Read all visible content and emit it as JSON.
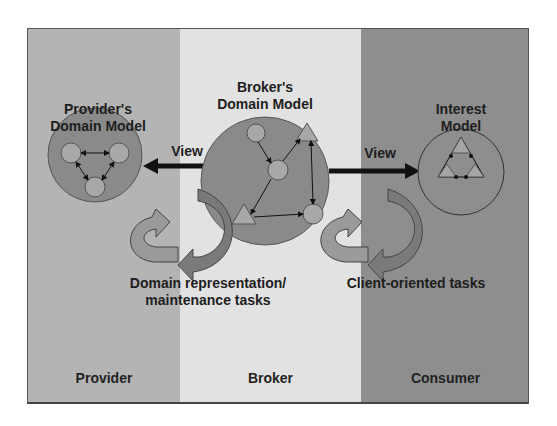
{
  "diagram": {
    "columns": [
      {
        "id": "provider",
        "label": "Provider",
        "color": "#b4b4b4"
      },
      {
        "id": "broker",
        "label": "Broker",
        "color": "#e2e2e2"
      },
      {
        "id": "consumer",
        "label": "Consumer",
        "color": "#8e8e8e"
      }
    ],
    "models": {
      "provider": {
        "title_line1": "Provider's",
        "title_line2": "Domain Model"
      },
      "broker": {
        "title_line1": "Broker's",
        "title_line2": "Domain Model"
      },
      "interest": {
        "title_line1": "Interest",
        "title_line2": "Model"
      }
    },
    "arrows": {
      "left_view": "View",
      "right_view": "View"
    },
    "tasks": {
      "domain_line1": "Domain representation/",
      "domain_line2": "maintenance tasks",
      "client": "Client-oriented tasks"
    }
  }
}
